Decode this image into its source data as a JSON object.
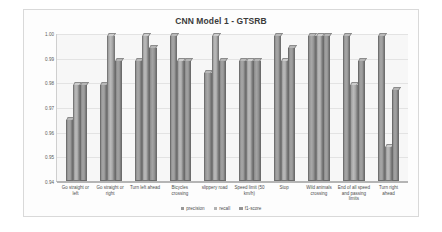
{
  "chart_data": {
    "type": "bar",
    "title": "CNN Model 1 - GTSRB",
    "xlabel": "",
    "ylabel": "",
    "ylim": [
      0.94,
      1.0
    ],
    "yticks": [
      "0.94",
      "0.95",
      "0.96",
      "0.97",
      "0.98",
      "0.99",
      "1.00"
    ],
    "grid": true,
    "legend_position": "bottom",
    "categories": [
      "Go straight or left",
      "Go straight or right",
      "Turn left ahead",
      "Bicycles crossing",
      "slippery road",
      "Speed limit (50 km/h)",
      "Stop",
      "Wild animals crossing",
      "End of all speed and passing limits",
      "Turn right ahead"
    ],
    "series": [
      {
        "name": "precision",
        "color": "#989898",
        "values": [
          0.966,
          0.98,
          0.99,
          1.0,
          0.985,
          0.99,
          1.0,
          1.0,
          1.0,
          1.0
        ]
      },
      {
        "name": "recall",
        "color": "#b2b2b2",
        "values": [
          0.98,
          1.0,
          1.0,
          0.99,
          1.0,
          0.99,
          0.99,
          1.0,
          0.98,
          0.955
        ]
      },
      {
        "name": "f1-score",
        "color": "#949494",
        "values": [
          0.98,
          0.99,
          0.995,
          0.99,
          0.99,
          0.99,
          0.995,
          1.0,
          0.99,
          0.978
        ]
      }
    ]
  }
}
